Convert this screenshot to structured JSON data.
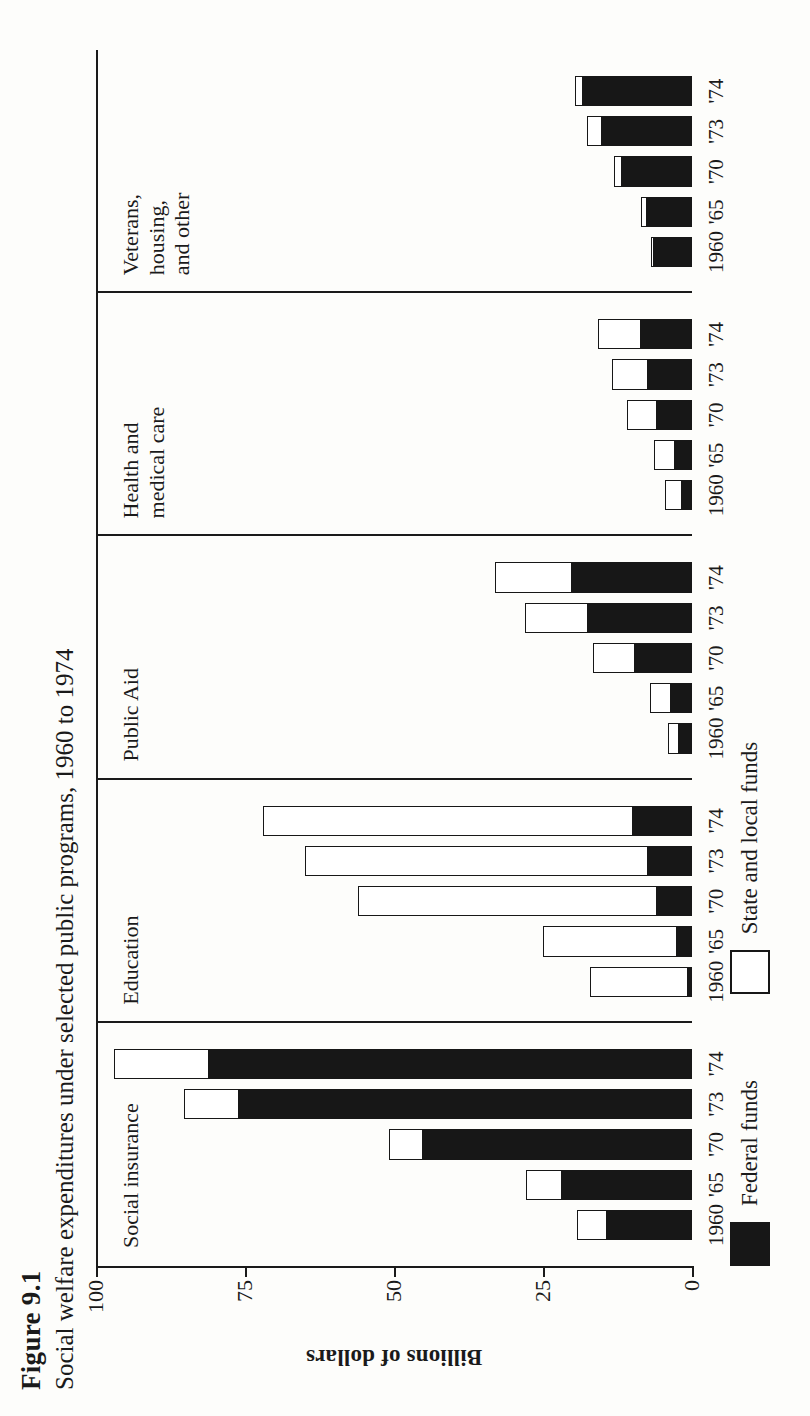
{
  "figure": {
    "number": "Figure 9.1",
    "title": "Social welfare expenditures under selected public programs, 1960 to 1974"
  },
  "axis": {
    "value_axis_title": "Billions of dollars",
    "ticks": [
      "0",
      "25",
      "50",
      "75",
      "100"
    ]
  },
  "legend": {
    "items": [
      {
        "key": "federal",
        "label": "Federal funds",
        "color": "#171717"
      },
      {
        "key": "state_local",
        "label": "State and local funds",
        "color": "#ffffff"
      }
    ]
  },
  "groups": [
    {
      "key": "social-insurance",
      "label": "Social insurance"
    },
    {
      "key": "education",
      "label": "Education"
    },
    {
      "key": "public-aid",
      "label": "Public Aid"
    },
    {
      "key": "health-medical",
      "label": "Health and\nmedical care"
    },
    {
      "key": "veterans-housing-other",
      "label": "Veterans,\nhousing,\nand other"
    }
  ],
  "chart_data": {
    "type": "bar",
    "subtype": "stacked-horizontal-grouped",
    "title": "Social welfare expenditures under selected public programs, 1960 to 1974",
    "xlabel": "",
    "ylabel": "Billions of dollars",
    "ylim": [
      0,
      100
    ],
    "yticks": [
      0,
      25,
      50,
      75,
      100
    ],
    "grid": false,
    "legend_position": "bottom-left",
    "categories": [
      "1960",
      "'65",
      "'70",
      "'73",
      "'74"
    ],
    "groups": [
      "Social insurance",
      "Education",
      "Public Aid",
      "Health and medical care",
      "Veterans, housing, and other"
    ],
    "series": [
      {
        "name": "Federal funds",
        "color": "#171717"
      },
      {
        "name": "State and local funds",
        "color": "#ffffff"
      }
    ],
    "data": {
      "Social insurance": {
        "1960": {
          "federal": 14.3,
          "state_local": 5.0,
          "total": 19.3
        },
        "'65": {
          "federal": 21.8,
          "state_local": 6.0,
          "total": 27.8
        },
        "'70": {
          "federal": 45.2,
          "state_local": 5.6,
          "total": 50.8
        },
        "'73": {
          "federal": 76.0,
          "state_local": 9.2,
          "total": 85.2
        },
        "'74": {
          "federal": 81.0,
          "state_local": 16.0,
          "total": 97.0
        }
      },
      "Education": {
        "1960": {
          "federal": 0.6,
          "state_local": 16.5,
          "total": 17.1
        },
        "'65": {
          "federal": 2.5,
          "state_local": 22.5,
          "total": 25.0
        },
        "'70": {
          "federal": 5.9,
          "state_local": 50.1,
          "total": 56.0
        },
        "'73": {
          "federal": 7.4,
          "state_local": 57.6,
          "total": 65.0
        },
        "'74": {
          "federal": 9.9,
          "state_local": 62.1,
          "total": 72.0
        }
      },
      "Public Aid": {
        "1960": {
          "federal": 2.1,
          "state_local": 1.9,
          "total": 4.0
        },
        "'65": {
          "federal": 3.6,
          "state_local": 3.5,
          "total": 7.1
        },
        "'70": {
          "federal": 9.6,
          "state_local": 7.0,
          "total": 16.6
        },
        "'73": {
          "federal": 17.5,
          "state_local": 10.5,
          "total": 28.0
        },
        "'74": {
          "federal": 20.2,
          "state_local": 12.8,
          "total": 33.0
        }
      },
      "Health and medical care": {
        "1960": {
          "federal": 1.7,
          "state_local": 2.9,
          "total": 4.6
        },
        "'65": {
          "federal": 2.8,
          "state_local": 3.6,
          "total": 6.4
        },
        "'70": {
          "federal": 5.9,
          "state_local": 5.0,
          "total": 10.9
        },
        "'73": {
          "federal": 7.3,
          "state_local": 6.1,
          "total": 13.4
        },
        "'74": {
          "federal": 8.6,
          "state_local": 7.2,
          "total": 15.8
        }
      },
      "Veterans, housing, and other": {
        "1960": {
          "federal": 6.4,
          "state_local": 0.5,
          "total": 6.9
        },
        "'65": {
          "federal": 7.6,
          "state_local": 1.0,
          "total": 8.6
        },
        "'70": {
          "federal": 11.7,
          "state_local": 1.4,
          "total": 13.1
        },
        "'73": {
          "federal": 15.1,
          "state_local": 2.5,
          "total": 17.6
        },
        "'74": {
          "federal": 18.3,
          "state_local": 1.3,
          "total": 19.6
        }
      }
    }
  }
}
